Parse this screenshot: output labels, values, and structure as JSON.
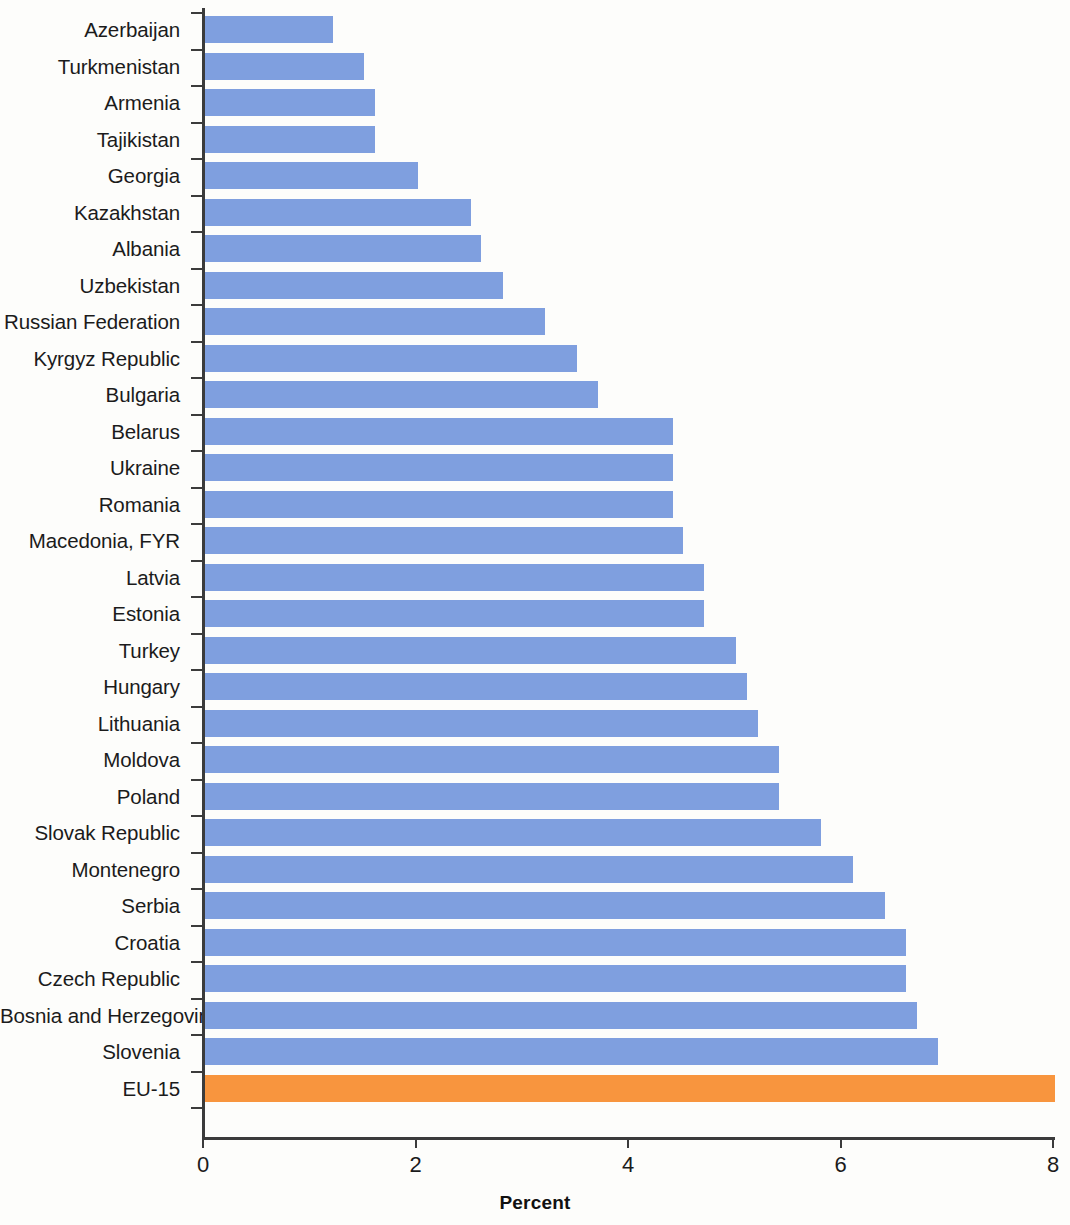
{
  "chart_data": {
    "type": "bar",
    "orientation": "horizontal",
    "title": "",
    "subtitle": "",
    "xlabel": "Percent",
    "ylabel": "",
    "xlim": [
      0,
      8
    ],
    "xticks": [
      0,
      2,
      4,
      6,
      8
    ],
    "xtick_labels": [
      "0",
      "2",
      "4",
      "6",
      "8"
    ],
    "grid": false,
    "legend": null,
    "colors": {
      "bar": "#7f9fdf",
      "highlight": "#f8953e",
      "axis": "#3b3b3b",
      "text": "#1b1b1b",
      "background": "#fdfdfb"
    },
    "highlight_category": "EU-15",
    "categories": [
      "Azerbaijan",
      "Turkmenistan",
      "Armenia",
      "Tajikistan",
      "Georgia",
      "Kazakhstan",
      "Albania",
      "Uzbekistan",
      "Russian Federation",
      "Kyrgyz Republic",
      "Bulgaria",
      "Belarus",
      "Ukraine",
      "Romania",
      "Macedonia, FYR",
      "Latvia",
      "Estonia",
      "Turkey",
      "Hungary",
      "Lithuania",
      "Moldova",
      "Poland",
      "Slovak Republic",
      "Montenegro",
      "Serbia",
      "Croatia",
      "Czech Republic",
      "Bosnia and Herzegovina",
      "Slovenia",
      "EU-15"
    ],
    "values": [
      1.2,
      1.5,
      1.6,
      1.6,
      2.0,
      2.5,
      2.6,
      2.8,
      3.2,
      3.5,
      3.7,
      4.4,
      4.4,
      4.4,
      4.5,
      4.7,
      4.7,
      5.0,
      5.1,
      5.2,
      5.4,
      5.4,
      5.8,
      6.1,
      6.4,
      6.6,
      6.6,
      6.7,
      6.9,
      8.0
    ]
  }
}
